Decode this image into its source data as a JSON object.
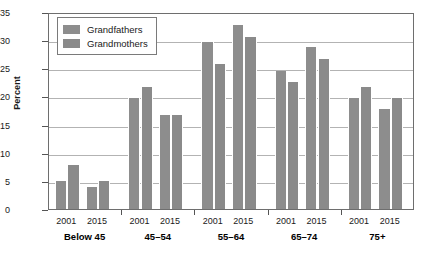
{
  "chart_data": {
    "type": "bar",
    "title": "",
    "xlabel": "",
    "ylabel": "Percent",
    "ylim": [
      0,
      35
    ],
    "ytick_step": 5,
    "yticks": [
      0,
      5,
      10,
      15,
      20,
      25,
      30,
      35
    ],
    "grid": true,
    "legend_position": "top-left",
    "categories": [
      "Below 45 2001",
      "Below 45 2015",
      "45–54 2001",
      "45–54 2015",
      "55–64 2001",
      "55–64 2015",
      "65–74 2001",
      "65–74 2015",
      "75+ 2001",
      "75+ 2015"
    ],
    "groups": [
      {
        "label": "Below 45",
        "years": [
          "2001",
          "2015"
        ],
        "values": {
          "Grandfathers": [
            5.0,
            3.9
          ],
          "Grandmothers": [
            7.9,
            5.0
          ]
        }
      },
      {
        "label": "45–54",
        "years": [
          "2001",
          "2015"
        ],
        "values": {
          "Grandfathers": [
            19.8,
            16.7
          ],
          "Grandmothers": [
            21.7,
            16.7
          ]
        }
      },
      {
        "label": "55–64",
        "years": [
          "2001",
          "2015"
        ],
        "values": {
          "Grandfathers": [
            29.7,
            32.7
          ],
          "Grandmothers": [
            25.7,
            30.6
          ]
        }
      },
      {
        "label": "65–74",
        "years": [
          "2001",
          "2015"
        ],
        "values": {
          "Grandfathers": [
            24.6,
            28.7
          ],
          "Grandmothers": [
            22.6,
            26.6
          ]
        }
      },
      {
        "label": "75+",
        "years": [
          "2001",
          "2015"
        ],
        "values": {
          "Grandfathers": [
            19.7,
            17.8
          ],
          "Grandmothers": [
            21.6,
            19.8
          ]
        }
      }
    ],
    "series": [
      {
        "name": "Grandfathers",
        "color": "#8d8d8d",
        "values": [
          5.0,
          3.9,
          19.8,
          16.7,
          29.7,
          32.7,
          24.6,
          28.7,
          19.7,
          17.8
        ]
      },
      {
        "name": "Grandmothers",
        "color": "#8a8a8a",
        "values": [
          7.9,
          5.0,
          21.7,
          16.7,
          25.7,
          30.6,
          22.6,
          26.6,
          21.6,
          19.8
        ]
      }
    ]
  },
  "legend": {
    "items": [
      {
        "label": "Grandfathers",
        "color": "#8d8d8d"
      },
      {
        "label": "Grandmothers",
        "color": "#8a8a8a"
      }
    ]
  },
  "axes": {
    "y_title": "Percent"
  },
  "colors": {
    "bar_fill": "#8d8d8d",
    "gridline": "#b3b3b3",
    "frame": "#6e6e6e",
    "text": "#1a1a1a",
    "background": "#ffffff"
  }
}
